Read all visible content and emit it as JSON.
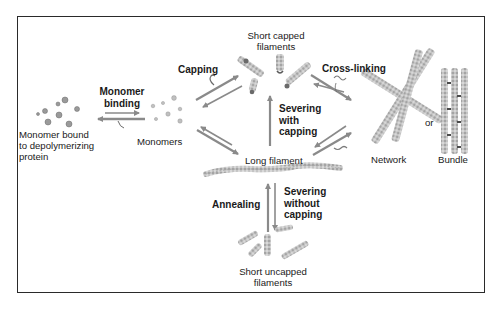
{
  "diagram": {
    "colors": {
      "arrow": "#8a8a8a",
      "filament": "#b8b8b8",
      "filament_dark": "#7a7a7a",
      "frame": "#2a2a2a",
      "text": "#1a1a1a"
    },
    "nodes": {
      "bound_monomer": {
        "label_line1": "Monomer bound",
        "label_line2": "to depolymerizing",
        "label_line3": "protein"
      },
      "monomers": {
        "label": "Monomers"
      },
      "short_capped": {
        "label_line1": "Short capped",
        "label_line2": "filaments"
      },
      "long_filament": {
        "label": "Long filament"
      },
      "short_uncapped": {
        "label_line1": "Short uncapped",
        "label_line2": "filaments"
      },
      "network": {
        "label": "Network"
      },
      "or": {
        "label": "or"
      },
      "bundle": {
        "label": "Bundle"
      }
    },
    "processes": {
      "monomer_binding": {
        "line1": "Monomer",
        "line2": "binding"
      },
      "capping": {
        "label": "Capping"
      },
      "cross_linking": {
        "label": "Cross-linking"
      },
      "severing_with_capping": {
        "line1": "Severing",
        "line2": "with",
        "line3": "capping"
      },
      "annealing": {
        "label": "Annealing"
      },
      "severing_without_capping": {
        "line1": "Severing",
        "line2": "without",
        "line3": "capping"
      }
    }
  }
}
